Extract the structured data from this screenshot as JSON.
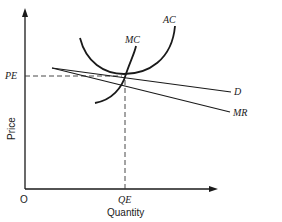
{
  "diagram": {
    "type": "economics-cost-revenue-diagram",
    "axes": {
      "y_label": "Price",
      "x_label": "Quantity",
      "origin_label": "O"
    },
    "equilibrium": {
      "price_label": "PE",
      "quantity_label": "QE"
    },
    "curves": {
      "ac_label": "AC",
      "mc_label": "MC",
      "d_label": "D",
      "mr_label": "MR"
    },
    "colors": {
      "ink": "#1a1a1a",
      "background": "#ffffff"
    }
  }
}
